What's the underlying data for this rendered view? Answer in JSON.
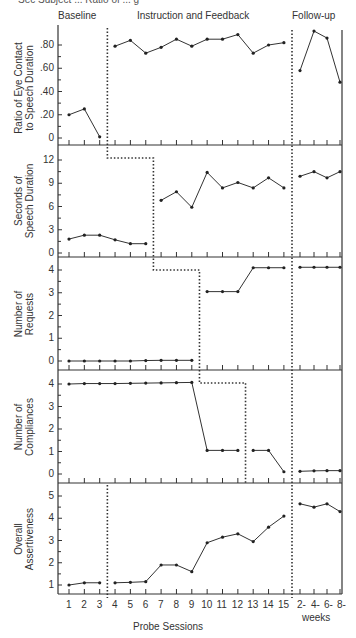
{
  "header": {
    "cutoff_text": "Sec Subject ... Ratio of ... g",
    "phases": [
      "Baseline",
      "Instruction and Feedback",
      "Follow-up"
    ]
  },
  "x_axis": {
    "label": "Probe Sessions",
    "ticks": [
      "1",
      "2",
      "3",
      "4",
      "5",
      "6",
      "7",
      "8",
      "9",
      "10",
      "11",
      "12",
      "13",
      "14",
      "15"
    ],
    "followup_ticks": [
      "2-",
      "4-",
      "6-",
      "8-"
    ],
    "followup_label": "weeks"
  },
  "chart_data": [
    {
      "type": "line",
      "title": "",
      "ylabel": "Ratio of Eye Contact to Speech Duration",
      "ylabel_lines": [
        "Ratio of Eye Contact",
        "to Speech Duration"
      ],
      "yticks": [
        "0",
        ".20",
        ".40",
        ".60",
        ".80"
      ],
      "ylim": [
        0,
        0.92
      ],
      "intervention_after_session": 3,
      "baseline": {
        "x": [
          1,
          2,
          3
        ],
        "y": [
          0.2,
          0.25,
          0.01
        ]
      },
      "treatment": {
        "x": [
          4,
          5,
          6,
          7,
          8,
          9,
          10,
          11,
          12,
          13,
          14,
          15
        ],
        "y": [
          0.79,
          0.84,
          0.73,
          0.78,
          0.85,
          0.79,
          0.85,
          0.85,
          0.89,
          0.73,
          0.8,
          0.82
        ]
      },
      "followup": {
        "x": [
          "2-",
          "4-",
          "6-",
          "8-"
        ],
        "y": [
          0.58,
          0.92,
          0.86,
          0.48
        ]
      }
    },
    {
      "type": "line",
      "ylabel": "Seconds of Speech Duration",
      "ylabel_lines": [
        "Seconds of",
        "Speech Duration"
      ],
      "yticks": [
        "0",
        "3",
        "6",
        "9",
        "12"
      ],
      "ylim": [
        0,
        13.5
      ],
      "intervention_after_session": 6,
      "baseline": {
        "x": [
          1,
          2,
          3,
          4,
          5,
          6
        ],
        "y": [
          1.8,
          2.3,
          2.3,
          1.7,
          1.2,
          1.2
        ]
      },
      "treatment": {
        "x": [
          7,
          8,
          9,
          10,
          11,
          12,
          13,
          14,
          15
        ],
        "y": [
          6.8,
          7.9,
          5.9,
          10.4,
          8.4,
          9.1,
          8.4,
          9.7,
          8.4
        ]
      },
      "followup": {
        "x": [
          "2-",
          "4-",
          "6-",
          "8-"
        ],
        "y": [
          9.9,
          10.5,
          9.7,
          10.5
        ]
      }
    },
    {
      "type": "line",
      "ylabel": "Number of Requests",
      "ylabel_lines": [
        "Number of",
        "Requests"
      ],
      "yticks": [
        "0",
        "1",
        "2",
        "3",
        "4"
      ],
      "ylim": [
        0,
        4.6
      ],
      "intervention_after_session": 9,
      "baseline": {
        "x": [
          1,
          2,
          3,
          4,
          5,
          6,
          7,
          8,
          9
        ],
        "y": [
          0,
          0,
          0,
          0,
          0,
          0.02,
          0.03,
          0.03,
          0.03
        ]
      },
      "treatment": {
        "x": [
          10,
          11,
          12,
          13,
          14,
          15
        ],
        "y": [
          3.05,
          3.05,
          3.05,
          4.1,
          4.1,
          4.1
        ]
      },
      "followup": {
        "x": [
          "2-",
          "4-",
          "6-",
          "8-"
        ],
        "y": [
          4.12,
          4.12,
          4.12,
          4.12
        ]
      }
    },
    {
      "type": "line",
      "ylabel": "Number of Compliances",
      "ylabel_lines": [
        "Number of",
        "Compliances"
      ],
      "yticks": [
        "0",
        "1",
        "2",
        "3",
        "4"
      ],
      "ylim": [
        0,
        4.5
      ],
      "intervention_after_session": 12,
      "baseline": {
        "x": [
          1,
          2,
          3,
          4,
          5,
          6,
          7,
          8,
          9,
          10,
          11,
          12
        ],
        "y": [
          4.0,
          4.02,
          4.02,
          4.02,
          4.03,
          4.04,
          4.05,
          4.06,
          4.07,
          1.05,
          1.05,
          1.05
        ]
      },
      "treatment": {
        "x": [
          13,
          14,
          15
        ],
        "y": [
          1.05,
          1.05,
          0.1
        ]
      },
      "followup": {
        "x": [
          "2-",
          "4-",
          "6-",
          "8-"
        ],
        "y": [
          0.12,
          0.14,
          0.15,
          0.15
        ]
      }
    },
    {
      "type": "line",
      "ylabel": "Overall Assertiveness",
      "ylabel_lines": [
        "Overall",
        "Assertiveness"
      ],
      "yticks": [
        "1",
        "2",
        "3",
        "4",
        "5"
      ],
      "ylim": [
        0.55,
        5.6
      ],
      "intervention_after_session": 3,
      "baseline": {
        "x": [
          1,
          2,
          3
        ],
        "y": [
          1.0,
          1.1,
          1.1
        ]
      },
      "treatment": {
        "x": [
          4,
          5,
          6,
          7,
          8,
          9,
          10,
          11,
          12,
          13,
          14,
          15
        ],
        "y": [
          1.1,
          1.12,
          1.15,
          1.9,
          1.9,
          1.6,
          2.9,
          3.15,
          3.3,
          2.95,
          3.6,
          4.1
        ]
      },
      "followup": {
        "x": [
          "2-",
          "4-",
          "6-",
          "8-"
        ],
        "y": [
          4.65,
          4.5,
          4.65,
          4.3
        ]
      }
    }
  ]
}
